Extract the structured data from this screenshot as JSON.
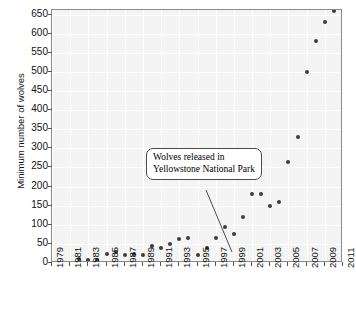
{
  "chart_data": {
    "type": "scatter",
    "title": "",
    "xlabel": "",
    "ylabel": "Minimum number of wolves",
    "xlim": [
      1979,
      2011
    ],
    "ylim": [
      0,
      662
    ],
    "grid": true,
    "legend": null,
    "ytick_labels": [
      "0",
      "50",
      "100",
      "150",
      "200",
      "250",
      "300",
      "350",
      "400",
      "450",
      "500",
      "550",
      "600",
      "650"
    ],
    "ytick_values": [
      0,
      50,
      100,
      150,
      200,
      250,
      300,
      350,
      400,
      450,
      500,
      550,
      600,
      650
    ],
    "xtick_labels": [
      "1979",
      "1981",
      "1983",
      "1985",
      "1987",
      "1989",
      "1991",
      "1993",
      "1995",
      "1997",
      "1999",
      "2001",
      "2003",
      "2005",
      "2007",
      "2009",
      "2011"
    ],
    "xtick_values": [
      1979,
      1981,
      1983,
      1985,
      1987,
      1989,
      1991,
      1993,
      1995,
      1997,
      1999,
      2001,
      2003,
      2005,
      2007,
      2009,
      2011
    ],
    "x": [
      1982,
      1983,
      1984,
      1985,
      1986,
      1987,
      1988,
      1989,
      1990,
      1991,
      1992,
      1993,
      1994,
      1995,
      1996,
      1997,
      1998,
      1999,
      2000,
      2001,
      2002,
      2003,
      2004,
      2005,
      2006,
      2007,
      2008,
      2009,
      2010
    ],
    "values": [
      10,
      7,
      8,
      24,
      28,
      22,
      23,
      22,
      44,
      38,
      50,
      62,
      65,
      20,
      40,
      65,
      95,
      75,
      120,
      180,
      180,
      150,
      160,
      265,
      330,
      500,
      580,
      630,
      660
    ],
    "annotations": [
      {
        "text_line1": "Wolves released in",
        "text_line2": "Yellowstone National Park",
        "points_to_year": 1996,
        "points_to_value": 40
      }
    ],
    "marker_color": "#3b3b3b",
    "plot_bg_color": "#f4f4f4",
    "grid_color": "#ffffff",
    "axis_color": "#8a8a8a"
  }
}
